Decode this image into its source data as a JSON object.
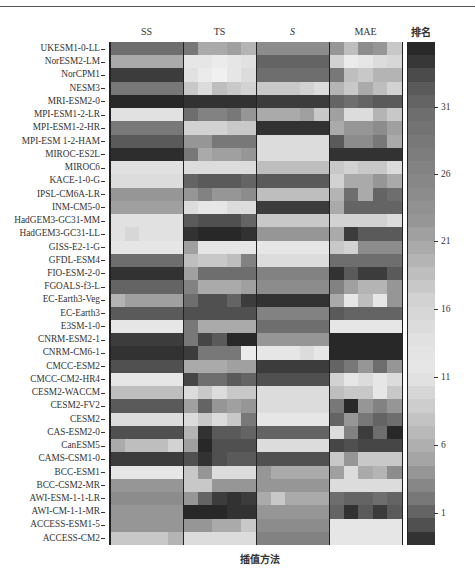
{
  "chart_data": {
    "type": "heatmap",
    "title": "",
    "xlabel": "插值方法",
    "ylabel": "",
    "column_groups": [
      "SS",
      "TS",
      "S",
      "MAE"
    ],
    "subcolumns_per_group": 5,
    "colorbar": {
      "label": "排名",
      "ticks": [
        1,
        6,
        11,
        16,
        21,
        26,
        31
      ],
      "range": [
        1,
        38
      ]
    },
    "rows": [
      "UKESM1-0-LL",
      "NorESM2-LM",
      "NorCPM1",
      "NESM3",
      "MRI-ESM2-0",
      "MPI-ESM1-2-LR",
      "MPI-ESM1-2-HR",
      "MPI-ESM 1-2-HAM",
      "MIROC-ES2L",
      "MIROC6",
      "KACE-1-0-G",
      "IPSL-CM6A-LR",
      "INM-CM5-0",
      "HadGEM3-GC31-MM",
      "HadGEM3-GC31-LL",
      "GISS-E2-1-G",
      "GFDL-ESM4",
      "FIO-ESM-2-0",
      "FGOALS-f3-L",
      "EC-Earth3-Veg",
      "EC-Earth3",
      "E3SM-1-0",
      "CNRM-ESM2-1",
      "CNRM-CM6-1",
      "CMCC-ESM2",
      "CMCC-CM2-HR4",
      "CESM2-WACCM",
      "CESM2-FV2",
      "CESM2",
      "CAS-ESM2-0",
      "CanESM5",
      "CAMS-CSM1-0",
      "BCC-ESM1",
      "BCC-CSM2-MR",
      "AWI-ESM-1-1-LR",
      "AWI-CM-1-1-MR",
      "ACCESS-ESM1-5",
      "ACCESS-CM2"
    ],
    "gray_values": [
      [
        110,
        110,
        110,
        110,
        110,
        120,
        170,
        170,
        160,
        180,
        140,
        140,
        140,
        140,
        140,
        150,
        190,
        140,
        150,
        200
      ],
      [
        170,
        170,
        170,
        170,
        170,
        230,
        230,
        235,
        230,
        225,
        100,
        100,
        100,
        100,
        100,
        210,
        235,
        230,
        220,
        215
      ],
      [
        60,
        60,
        60,
        60,
        60,
        225,
        235,
        240,
        230,
        220,
        110,
        110,
        110,
        110,
        110,
        120,
        190,
        200,
        180,
        180
      ],
      [
        120,
        120,
        120,
        120,
        120,
        200,
        220,
        190,
        200,
        210,
        200,
        200,
        200,
        210,
        220,
        180,
        200,
        170,
        190,
        210
      ],
      [
        40,
        40,
        40,
        40,
        40,
        50,
        50,
        50,
        50,
        50,
        60,
        60,
        60,
        60,
        60,
        100,
        110,
        100,
        90,
        90
      ],
      [
        225,
        225,
        225,
        225,
        225,
        110,
        130,
        130,
        120,
        150,
        170,
        170,
        170,
        160,
        200,
        160,
        220,
        220,
        180,
        200
      ],
      [
        120,
        120,
        120,
        120,
        120,
        210,
        210,
        210,
        200,
        200,
        50,
        50,
        50,
        50,
        50,
        170,
        150,
        150,
        140,
        160
      ],
      [
        90,
        90,
        90,
        90,
        90,
        150,
        150,
        120,
        120,
        120,
        220,
        220,
        220,
        220,
        220,
        90,
        140,
        140,
        120,
        170
      ],
      [
        45,
        45,
        45,
        45,
        45,
        120,
        170,
        160,
        160,
        150,
        220,
        220,
        220,
        220,
        220,
        50,
        50,
        50,
        50,
        50
      ],
      [
        225,
        225,
        225,
        225,
        225,
        220,
        220,
        220,
        220,
        220,
        190,
        190,
        190,
        190,
        190,
        200,
        210,
        200,
        200,
        220
      ],
      [
        220,
        220,
        220,
        220,
        220,
        100,
        90,
        90,
        90,
        100,
        90,
        90,
        90,
        90,
        90,
        210,
        170,
        170,
        150,
        170
      ],
      [
        150,
        150,
        150,
        150,
        150,
        150,
        130,
        150,
        150,
        140,
        190,
        190,
        190,
        190,
        190,
        180,
        110,
        170,
        100,
        110
      ],
      [
        160,
        160,
        160,
        160,
        160,
        220,
        230,
        230,
        220,
        220,
        60,
        60,
        60,
        60,
        60,
        170,
        100,
        100,
        100,
        100
      ],
      [
        225,
        225,
        225,
        225,
        225,
        90,
        80,
        80,
        80,
        100,
        200,
        200,
        200,
        200,
        200,
        210,
        210,
        210,
        210,
        220
      ],
      [
        225,
        215,
        225,
        225,
        225,
        50,
        40,
        40,
        40,
        50,
        150,
        150,
        150,
        150,
        150,
        170,
        60,
        90,
        90,
        90
      ],
      [
        230,
        230,
        230,
        230,
        230,
        160,
        230,
        230,
        230,
        230,
        230,
        230,
        230,
        230,
        230,
        200,
        210,
        140,
        140,
        140
      ],
      [
        110,
        110,
        110,
        110,
        110,
        190,
        200,
        200,
        190,
        130,
        220,
        220,
        220,
        220,
        220,
        110,
        110,
        110,
        110,
        110
      ],
      [
        50,
        50,
        50,
        50,
        50,
        160,
        110,
        110,
        110,
        110,
        130,
        130,
        130,
        130,
        130,
        50,
        90,
        60,
        60,
        90
      ],
      [
        100,
        100,
        100,
        100,
        100,
        130,
        170,
        170,
        170,
        160,
        140,
        140,
        140,
        140,
        140,
        130,
        160,
        180,
        180,
        150
      ],
      [
        180,
        160,
        160,
        160,
        160,
        110,
        80,
        80,
        100,
        60,
        50,
        50,
        50,
        50,
        50,
        170,
        230,
        190,
        230,
        150
      ],
      [
        90,
        90,
        90,
        90,
        90,
        80,
        80,
        80,
        80,
        80,
        130,
        130,
        130,
        130,
        130,
        90,
        100,
        100,
        100,
        100
      ],
      [
        230,
        230,
        230,
        230,
        230,
        120,
        170,
        170,
        170,
        170,
        110,
        110,
        110,
        110,
        110,
        230,
        230,
        230,
        230,
        230
      ],
      [
        60,
        60,
        60,
        60,
        60,
        120,
        70,
        90,
        40,
        40,
        150,
        150,
        150,
        150,
        150,
        40,
        40,
        40,
        40,
        40
      ],
      [
        50,
        50,
        50,
        50,
        50,
        60,
        120,
        120,
        120,
        235,
        230,
        230,
        230,
        220,
        230,
        40,
        40,
        40,
        40,
        40
      ],
      [
        80,
        80,
        80,
        80,
        80,
        170,
        170,
        170,
        160,
        160,
        60,
        60,
        60,
        60,
        60,
        100,
        120,
        150,
        110,
        150
      ],
      [
        230,
        230,
        230,
        230,
        230,
        70,
        110,
        110,
        90,
        100,
        80,
        80,
        80,
        80,
        80,
        210,
        230,
        220,
        230,
        220
      ],
      [
        190,
        190,
        190,
        190,
        190,
        220,
        200,
        220,
        200,
        200,
        220,
        220,
        220,
        220,
        220,
        190,
        200,
        200,
        230,
        200
      ],
      [
        90,
        90,
        90,
        90,
        90,
        160,
        100,
        150,
        160,
        150,
        220,
        220,
        220,
        220,
        220,
        120,
        40,
        150,
        130,
        150
      ],
      [
        220,
        220,
        220,
        220,
        220,
        220,
        200,
        220,
        200,
        120,
        230,
        230,
        230,
        230,
        230,
        100,
        150,
        120,
        100,
        110
      ],
      [
        80,
        80,
        80,
        80,
        80,
        180,
        50,
        90,
        90,
        100,
        100,
        100,
        100,
        100,
        100,
        220,
        130,
        60,
        110,
        40
      ],
      [
        170,
        190,
        190,
        190,
        210,
        160,
        40,
        80,
        80,
        80,
        220,
        220,
        220,
        220,
        220,
        70,
        80,
        70,
        70,
        70
      ],
      [
        60,
        60,
        60,
        60,
        60,
        80,
        50,
        80,
        90,
        90,
        80,
        80,
        80,
        80,
        80,
        200,
        150,
        200,
        200,
        200
      ],
      [
        230,
        230,
        230,
        230,
        230,
        200,
        150,
        220,
        220,
        220,
        150,
        170,
        170,
        170,
        170,
        160,
        220,
        170,
        180,
        140
      ],
      [
        150,
        150,
        150,
        150,
        150,
        200,
        200,
        150,
        150,
        150,
        150,
        150,
        150,
        150,
        150,
        220,
        220,
        220,
        220,
        220
      ],
      [
        140,
        140,
        140,
        140,
        140,
        150,
        100,
        60,
        50,
        60,
        170,
        200,
        170,
        170,
        170,
        110,
        100,
        100,
        110,
        100
      ],
      [
        150,
        150,
        150,
        150,
        150,
        40,
        40,
        40,
        50,
        50,
        150,
        150,
        150,
        150,
        150,
        100,
        50,
        90,
        60,
        90
      ],
      [
        150,
        150,
        150,
        150,
        150,
        150,
        150,
        170,
        170,
        200,
        140,
        140,
        140,
        140,
        140,
        230,
        230,
        230,
        230,
        230
      ],
      [
        200,
        200,
        200,
        200,
        180,
        220,
        220,
        220,
        220,
        220,
        130,
        130,
        130,
        130,
        130,
        230,
        230,
        230,
        230,
        230
      ]
    ],
    "colorbar_gray": [
      40,
      55,
      75,
      90,
      100,
      110,
      115,
      120,
      125,
      130,
      135,
      140,
      145,
      150,
      160,
      170,
      180,
      190,
      200,
      210,
      215,
      220,
      225,
      228,
      230,
      225,
      215,
      205,
      195,
      185,
      175,
      165,
      150,
      135,
      120,
      100,
      80,
      50
    ]
  },
  "labels": {
    "col_ss": "SS",
    "col_ts": "TS",
    "col_s": "S",
    "col_mae": "MAE",
    "rank": "排名",
    "xlabel": "插值方法",
    "ticks": {
      "t31": "31",
      "t26": "26",
      "t21": "21",
      "t16": "16",
      "t11": "11",
      "t6": "6",
      "t1": "1"
    }
  }
}
